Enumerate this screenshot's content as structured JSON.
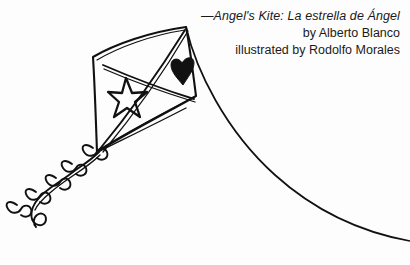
{
  "page": {
    "background_color": "#fdfdfd",
    "ink_color": "#111111",
    "width": 410,
    "height": 265
  },
  "caption": {
    "title_line": "—Angel's Kite: La estrella de Ángel",
    "author_line": "by Alberto Blanco",
    "illustrator_line": "illustrated by Rodolfo Morales",
    "alignment": "right",
    "title_style": "italic"
  },
  "artwork": {
    "name": "kite-line-drawing",
    "description": "Black ink line drawing of a diamond kite flying with a long curving string and a ribboned tail",
    "elements": [
      {
        "name": "kite-body",
        "label": "Diamond kite sail"
      },
      {
        "name": "kite-spar-vertical",
        "label": "Vertical spar"
      },
      {
        "name": "kite-spar-horizontal",
        "label": "Horizontal spar"
      },
      {
        "name": "star-motif",
        "label": "Outlined five-pointed star"
      },
      {
        "name": "heart-motif",
        "label": "Solid black heart"
      },
      {
        "name": "kite-string",
        "label": "Curving kite string"
      },
      {
        "name": "kite-tail",
        "label": "Wavy tail with bow ribbons"
      },
      {
        "name": "tail-spiral",
        "label": "Spiral curl at tail end"
      }
    ],
    "ribbon_count": 5
  }
}
